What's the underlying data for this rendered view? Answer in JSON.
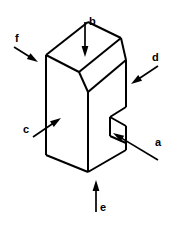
{
  "figure": {
    "background_color": "#ffffff",
    "line_color": "#000000",
    "width": 173,
    "height": 227
  },
  "solid": {
    "name": "chamfered-notched-block",
    "stroke_color": "#000000",
    "fill_color": "#ffffff",
    "stroke_width": 2,
    "outline_points": "46,55 46,155 88,172 126,150 126,60 121,56 121,38 88,22",
    "top_rear_face_points": "46,55 88,22 121,38 79,72",
    "chamfer_face_points": "79,72 121,38 126,60 88,92",
    "front_left_face_points": "46,55 79,72 88,92 88,172 46,155",
    "front_right_face_points": "88,92 126,60 126,150 88,172",
    "notch_points": "126,107 110,117 110,136 126,143",
    "notch_inner_points": "110,117 126,126 126,143",
    "edges": [
      {
        "name": "left-vertical-edge",
        "points": "46,55 46,155"
      },
      {
        "name": "bottom-left-edge",
        "points": "46,155 88,172"
      },
      {
        "name": "bottom-right-edge",
        "points": "88,172 126,150"
      },
      {
        "name": "right-vertical-edge-upper",
        "points": "126,60 126,107"
      },
      {
        "name": "right-vertical-edge-lower",
        "points": "126,143 126,150"
      },
      {
        "name": "front-vertical-edge",
        "points": "88,92 88,172"
      },
      {
        "name": "top-rear-left-edge",
        "points": "46,55 88,22"
      },
      {
        "name": "top-rear-right-edge",
        "points": "88,22 121,38"
      },
      {
        "name": "chamfer-upper-edge",
        "points": "79,72 121,38"
      },
      {
        "name": "chamfer-left-edge",
        "points": "46,55 79,72"
      },
      {
        "name": "chamfer-lower-edge",
        "points": "79,72 88,92"
      },
      {
        "name": "chamfer-right-edge",
        "points": "121,38 126,60"
      },
      {
        "name": "top-front-edge",
        "points": "88,92 126,60"
      },
      {
        "name": "notch-top-edge",
        "points": "126,107 110,117"
      },
      {
        "name": "notch-left-edge",
        "points": "110,117 110,136"
      },
      {
        "name": "notch-bottom-edge",
        "points": "110,136 126,143"
      },
      {
        "name": "notch-inner-diagonal",
        "points": "110,117 126,126"
      },
      {
        "name": "notch-inner-vertical",
        "points": "126,126 126,143"
      }
    ]
  },
  "arrows": [
    {
      "id": "a",
      "label": "a",
      "target_face": "front-right-face",
      "direction": "up-left",
      "tail_x": 158,
      "tail_y": 160,
      "tip_x": 113,
      "tip_y": 133,
      "label_x": 155,
      "label_y": 146
    },
    {
      "id": "b",
      "label": "b",
      "target_face": "top-rear-face",
      "direction": "down",
      "tail_x": 85,
      "tail_y": 22,
      "tip_x": 85,
      "tip_y": 57,
      "label_x": 89,
      "label_y": 25
    },
    {
      "id": "c",
      "label": "c",
      "target_face": "front-left-face",
      "direction": "up-right",
      "tail_x": 33,
      "tail_y": 137,
      "tip_x": 61,
      "tip_y": 118,
      "label_x": 23,
      "label_y": 133
    },
    {
      "id": "d",
      "label": "d",
      "target_face": "chamfer-right-face",
      "direction": "down-left",
      "tail_x": 158,
      "tail_y": 66,
      "tip_x": 131,
      "tip_y": 84,
      "label_x": 152,
      "label_y": 61
    },
    {
      "id": "e",
      "label": "e",
      "target_face": "bottom-face",
      "direction": "up",
      "tail_x": 96,
      "tail_y": 212,
      "tip_x": 96,
      "tip_y": 180,
      "label_x": 100,
      "label_y": 211
    },
    {
      "id": "f",
      "label": "f",
      "target_face": "top-rear-left-face",
      "direction": "down-right",
      "tail_x": 14,
      "tail_y": 47,
      "tip_x": 38,
      "tip_y": 62,
      "label_x": 15,
      "label_y": 42
    }
  ]
}
